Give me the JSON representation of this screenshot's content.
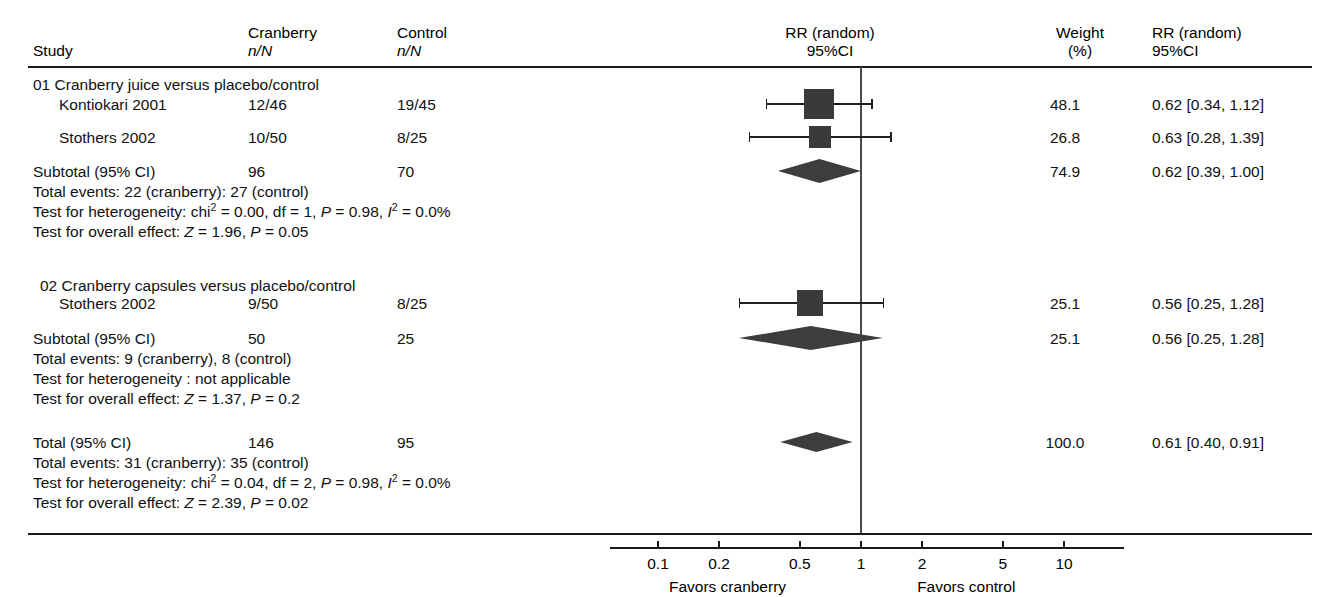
{
  "header": {
    "col_study": "Study",
    "col_treat_line1": "Cranberry",
    "col_treat_line2": "n/N",
    "col_ctrl_line1": "Control",
    "col_ctrl_line2": "n/N",
    "col_plot_line1": "RR (random)",
    "col_plot_line2": "95%CI",
    "col_weight_line1": "Weight",
    "col_weight_line2": "(%)",
    "col_effect_line1": "RR (random)",
    "col_effect_line2": "95%CI"
  },
  "axis": {
    "ticks": [
      "0.1",
      "0.2",
      "0.5",
      "1",
      "2",
      "5",
      "10"
    ],
    "tick_values": [
      0.1,
      0.2,
      0.5,
      1,
      2,
      5,
      10
    ],
    "left_label": "Favors cranberry",
    "right_label": "Favors control",
    "scale": "log",
    "null_value": 1
  },
  "groups": [
    {
      "id": "01",
      "title": "01  Cranberry juice versus placebo/control",
      "studies": [
        {
          "name": "Kontiokari 2001",
          "treat": "12/46",
          "control": "19/45",
          "weight": "48.1",
          "effect": "0.62 [0.34, 1.12]",
          "rr": 0.62,
          "ci_low": 0.34,
          "ci_high": 1.12
        },
        {
          "name": "Stothers 2002",
          "treat": "10/50",
          "control": "8/25",
          "weight": "26.8",
          "effect": "0.63 [0.28, 1.39]",
          "rr": 0.63,
          "ci_low": 0.28,
          "ci_high": 1.39
        }
      ],
      "subtotal": {
        "label": "Subtotal (95% CI)",
        "treat": "96",
        "control": "70",
        "weight": "74.9",
        "effect": "0.62 [0.39, 1.00]",
        "rr": 0.62,
        "ci_low": 0.39,
        "ci_high": 1.0
      },
      "total_events": "Total events: 22 (cranberry): 27 (control)",
      "heterogeneity": {
        "prefix": "Test for heterogeneity: chi",
        "mid": " = 0.00, df = 1, ",
        "p_italic": "P",
        "p_text": " = 0.98, ",
        "i_italic": "I",
        "i_text": " = 0.0%"
      },
      "overall_effect": {
        "prefix": "Test for overall effect: ",
        "z_italic": "Z",
        "z_text": " = 1.96, ",
        "p_italic": "P",
        "p_text": " = 0.05"
      }
    },
    {
      "id": "02",
      "title": "02 Cranberry capsules versus placebo/control",
      "studies": [
        {
          "name": "Stothers 2002",
          "treat": "9/50",
          "control": "8/25",
          "weight": "25.1",
          "effect": "0.56 [0.25, 1.28]",
          "rr": 0.56,
          "ci_low": 0.25,
          "ci_high": 1.28
        }
      ],
      "subtotal": {
        "label": "Subtotal (95% CI)",
        "treat": "50",
        "control": "25",
        "weight": "25.1",
        "effect": "0.56 [0.25, 1.28]",
        "rr": 0.56,
        "ci_low": 0.25,
        "ci_high": 1.28
      },
      "total_events": "Total events: 9 (cranberry), 8 (control)",
      "heterogeneity_plain": "Test for heterogeneity : not applicable",
      "overall_effect": {
        "prefix": "Test for overall effect: ",
        "z_italic": "Z",
        "z_text": " = 1.37, ",
        "p_italic": "P",
        "p_text": " = 0.2"
      }
    }
  ],
  "grand_total": {
    "label": "Total (95% CI)",
    "treat": "146",
    "control": "95",
    "weight": "100.0",
    "effect": "0.61 [0.40, 0.91]",
    "rr": 0.61,
    "ci_low": 0.4,
    "ci_high": 0.91,
    "total_events": "Total events: 31 (cranberry): 35 (control)",
    "heterogeneity": {
      "prefix": "Test for heterogeneity: chi",
      "mid": " = 0.04, df = 2, ",
      "p_italic": "P",
      "p_text": " = 0.98, ",
      "i_italic": "I",
      "i_text": " = 0.0%"
    },
    "overall_effect": {
      "prefix": "Test for overall effect: ",
      "z_italic": "Z",
      "z_text": " = 2.39, ",
      "p_italic": "P",
      "p_text": " = 0.02"
    }
  },
  "chart_data": {
    "type": "forest",
    "title": "",
    "xlabel": "RR (random) 95%CI",
    "scale": "log",
    "xlim": [
      0.1,
      10
    ],
    "xticks": [
      0.1,
      0.2,
      0.5,
      1,
      2,
      5,
      10
    ],
    "null_line": 1,
    "rows": [
      {
        "label": "Kontiokari 2001",
        "group": "01 Cranberry juice versus placebo/control",
        "kind": "study",
        "n_treat": "12/46",
        "n_control": "19/45",
        "rr": 0.62,
        "ci_low": 0.34,
        "ci_high": 1.12,
        "weight": 48.1
      },
      {
        "label": "Stothers 2002",
        "group": "01 Cranberry juice versus placebo/control",
        "kind": "study",
        "n_treat": "10/50",
        "n_control": "8/25",
        "rr": 0.63,
        "ci_low": 0.28,
        "ci_high": 1.39,
        "weight": 26.8
      },
      {
        "label": "Subtotal (95% CI)",
        "group": "01 Cranberry juice versus placebo/control",
        "kind": "subtotal",
        "n_treat": "96",
        "n_control": "70",
        "rr": 0.62,
        "ci_low": 0.39,
        "ci_high": 1.0,
        "weight": 74.9
      },
      {
        "label": "Stothers 2002",
        "group": "02 Cranberry capsules versus placebo/control",
        "kind": "study",
        "n_treat": "9/50",
        "n_control": "8/25",
        "rr": 0.56,
        "ci_low": 0.25,
        "ci_high": 1.28,
        "weight": 25.1
      },
      {
        "label": "Subtotal (95% CI)",
        "group": "02 Cranberry capsules versus placebo/control",
        "kind": "subtotal",
        "n_treat": "50",
        "n_control": "25",
        "rr": 0.56,
        "ci_low": 0.25,
        "ci_high": 1.28,
        "weight": 25.1
      },
      {
        "label": "Total (95% CI)",
        "group": "",
        "kind": "total",
        "n_treat": "146",
        "n_control": "95",
        "rr": 0.61,
        "ci_low": 0.4,
        "ci_high": 0.91,
        "weight": 100.0
      }
    ]
  }
}
